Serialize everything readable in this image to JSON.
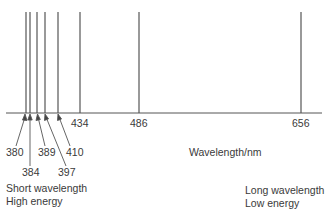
{
  "diagram": {
    "axis_label": "Wavelength/nm",
    "left_note": {
      "line1": "Short wavelength",
      "line2": "High energy"
    },
    "right_note": {
      "line1": "Long wavelength",
      "line2": "Low energy"
    },
    "line_color": "#555555",
    "lines": [
      {
        "wavelength": "380",
        "x": 26
      },
      {
        "wavelength": "384",
        "x": 30
      },
      {
        "wavelength": "389",
        "x": 37
      },
      {
        "wavelength": "397",
        "x": 45
      },
      {
        "wavelength": "410",
        "x": 58
      },
      {
        "wavelength": "434",
        "x": 80
      },
      {
        "wavelength": "486",
        "x": 139
      },
      {
        "wavelength": "656",
        "x": 301
      }
    ],
    "labels": {
      "l380": "380",
      "l384": "384",
      "l389": "389",
      "l397": "397",
      "l410": "410",
      "l434": "434",
      "l486": "486",
      "l656": "656"
    }
  }
}
